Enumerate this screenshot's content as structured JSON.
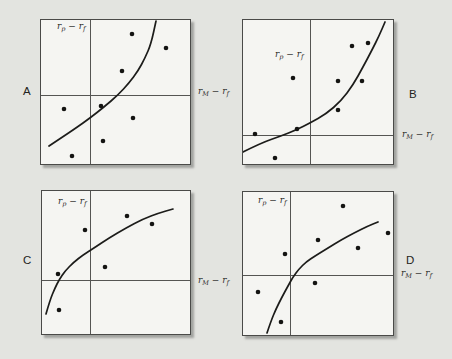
{
  "figure": {
    "background_color": "#e3e4e0",
    "panel_background_color": "#f5f5f2",
    "border_color": "#4a4a48",
    "axis_line_color": "#555553",
    "curve_color": "#1c1c1a",
    "dot_color": "#141412",
    "dot_radius": 2.3,
    "curve_width": 1.7
  },
  "chart_data": [
    {
      "type": "scatter",
      "panel": "A",
      "letter": "A",
      "letter_side": "left",
      "y_axis_label": "r_p − r_f",
      "x_axis_label": "r_M − r_f",
      "curve_shape": "convex-increasing",
      "box": {
        "left": 40,
        "top": 19,
        "width": 151,
        "height": 146
      },
      "axis_cross": {
        "x": 49,
        "y": 75
      },
      "points": [
        [
          91,
          14
        ],
        [
          125,
          28
        ],
        [
          81,
          51
        ],
        [
          60,
          86
        ],
        [
          23,
          89
        ],
        [
          92,
          98
        ],
        [
          62,
          121
        ],
        [
          31,
          136
        ]
      ],
      "curve_points": [
        [
          8,
          126
        ],
        [
          20,
          118
        ],
        [
          35,
          108
        ],
        [
          49,
          98
        ],
        [
          63,
          87
        ],
        [
          77,
          75
        ],
        [
          88,
          63
        ],
        [
          97,
          51
        ],
        [
          104,
          38
        ],
        [
          110,
          24
        ],
        [
          115,
          1
        ]
      ],
      "letter_pos": {
        "left": 23,
        "top": 85
      },
      "x_label_pos": {
        "left": 198,
        "top": 85
      },
      "y_label_offset": {
        "left": 17,
        "top": 1
      }
    },
    {
      "type": "scatter",
      "panel": "B",
      "letter": "B",
      "letter_side": "right",
      "y_axis_label": "r_p − r_f",
      "x_axis_label": "r_M − r_f",
      "curve_shape": "convex-increasing",
      "box": {
        "left": 242,
        "top": 19,
        "width": 152,
        "height": 146
      },
      "axis_cross": {
        "x": 67,
        "y": 115
      },
      "points": [
        [
          109,
          26
        ],
        [
          125,
          23
        ],
        [
          50,
          58
        ],
        [
          95,
          61
        ],
        [
          119,
          61
        ],
        [
          95,
          90
        ],
        [
          54,
          109
        ],
        [
          12,
          114
        ],
        [
          32,
          138
        ]
      ],
      "curve_points": [
        [
          0,
          132
        ],
        [
          18,
          123
        ],
        [
          38,
          116
        ],
        [
          53,
          110
        ],
        [
          67,
          103
        ],
        [
          83,
          94
        ],
        [
          98,
          81
        ],
        [
          110,
          65
        ],
        [
          120,
          47
        ],
        [
          129,
          30
        ],
        [
          136,
          16
        ],
        [
          142,
          2
        ]
      ],
      "letter_pos": {
        "left": 409,
        "top": 88
      },
      "x_label_pos": {
        "left": 402,
        "top": 128
      },
      "y_label_offset": {
        "left": 33,
        "top": 29
      }
    },
    {
      "type": "scatter",
      "panel": "C",
      "letter": "C",
      "letter_side": "left",
      "y_axis_label": "r_p − r_f",
      "x_axis_label": "r_M − r_f",
      "curve_shape": "concave-increasing",
      "box": {
        "left": 41,
        "top": 190,
        "width": 150,
        "height": 145
      },
      "axis_cross": {
        "x": 48,
        "y": 89
      },
      "points": [
        [
          85,
          25
        ],
        [
          110,
          33
        ],
        [
          43,
          39
        ],
        [
          63,
          76
        ],
        [
          16,
          83
        ],
        [
          17,
          119
        ]
      ],
      "curve_points": [
        [
          4,
          123
        ],
        [
          8,
          109
        ],
        [
          13,
          97
        ],
        [
          17,
          89
        ],
        [
          23,
          80
        ],
        [
          32,
          71
        ],
        [
          41,
          64
        ],
        [
          52,
          57
        ],
        [
          67,
          47
        ],
        [
          84,
          37
        ],
        [
          101,
          28
        ],
        [
          117,
          22
        ],
        [
          131,
          18
        ]
      ],
      "letter_pos": {
        "left": 23,
        "top": 254
      },
      "x_label_pos": {
        "left": 198,
        "top": 274
      },
      "y_label_offset": {
        "left": 17,
        "top": 5
      }
    },
    {
      "type": "scatter",
      "panel": "D",
      "letter": "D",
      "letter_side": "right",
      "y_axis_label": "r_p − r_f",
      "x_axis_label": "r_M − r_f",
      "curve_shape": "concave-increasing",
      "box": {
        "left": 242,
        "top": 191,
        "width": 152,
        "height": 145
      },
      "axis_cross": {
        "x": 47,
        "y": 83
      },
      "points": [
        [
          100,
          14
        ],
        [
          145,
          41
        ],
        [
          75,
          48
        ],
        [
          115,
          56
        ],
        [
          42,
          62
        ],
        [
          72,
          91
        ],
        [
          15,
          100
        ],
        [
          38,
          130
        ]
      ],
      "curve_points": [
        [
          24,
          141
        ],
        [
          28,
          129
        ],
        [
          33,
          117
        ],
        [
          39,
          105
        ],
        [
          45,
          94
        ],
        [
          50,
          85
        ],
        [
          56,
          77
        ],
        [
          63,
          70
        ],
        [
          72,
          64
        ],
        [
          85,
          56
        ],
        [
          98,
          48
        ],
        [
          111,
          41
        ],
        [
          125,
          34
        ],
        [
          135,
          30
        ]
      ],
      "letter_pos": {
        "left": 406,
        "top": 254
      },
      "x_label_pos": {
        "left": 401,
        "top": 267
      },
      "y_label_offset": {
        "left": 16,
        "top": 3
      }
    }
  ]
}
